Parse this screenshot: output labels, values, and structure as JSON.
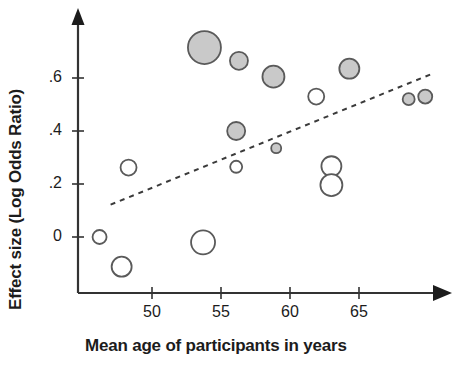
{
  "chart_data": {
    "type": "scatter",
    "title": "",
    "xlabel": "Mean age of participants in years",
    "ylabel": "Effect size (Log Odds Ratio)",
    "xlim": [
      45.2,
      72.0
    ],
    "ylim": [
      -0.16,
      0.82
    ],
    "xticks": [
      50,
      55,
      60,
      65
    ],
    "xtick_labels": [
      "50",
      "55",
      "60",
      "65"
    ],
    "yticks": [
      0,
      0.2,
      0.4,
      0.6
    ],
    "ytick_labels": [
      "0",
      ".2",
      ".4",
      ".6"
    ],
    "grid": false,
    "legend": "none",
    "marker_encoding": {
      "size": "study weight / sample size",
      "fill_gray": "statistically significant",
      "fill_white": "not statistically significant"
    },
    "colors": {
      "axis": "#333333",
      "marker_fill_gray": "#c9c9c9",
      "marker_fill_white": "#ffffff",
      "marker_stroke": "#5a5a5a",
      "trend_line": "#3a3a3a",
      "text": "#1c1c1c"
    },
    "points": [
      {
        "x": 53.8,
        "y": 0.715,
        "size": 16.5,
        "fill": "gray"
      },
      {
        "x": 56.3,
        "y": 0.665,
        "size": 9.0,
        "fill": "gray"
      },
      {
        "x": 58.8,
        "y": 0.605,
        "size": 11.0,
        "fill": "gray"
      },
      {
        "x": 64.3,
        "y": 0.635,
        "size": 10.0,
        "fill": "gray"
      },
      {
        "x": 61.9,
        "y": 0.53,
        "size": 8.0,
        "fill": "white"
      },
      {
        "x": 68.6,
        "y": 0.52,
        "size": 6.0,
        "fill": "gray"
      },
      {
        "x": 69.8,
        "y": 0.53,
        "size": 7.0,
        "fill": "gray"
      },
      {
        "x": 56.1,
        "y": 0.4,
        "size": 9.0,
        "fill": "gray"
      },
      {
        "x": 59.0,
        "y": 0.335,
        "size": 5.0,
        "fill": "gray"
      },
      {
        "x": 56.1,
        "y": 0.265,
        "size": 6.0,
        "fill": "white"
      },
      {
        "x": 48.3,
        "y": 0.262,
        "size": 8.0,
        "fill": "white"
      },
      {
        "x": 63.0,
        "y": 0.267,
        "size": 10.0,
        "fill": "white"
      },
      {
        "x": 63.0,
        "y": 0.196,
        "size": 11.0,
        "fill": "white"
      },
      {
        "x": 46.2,
        "y": 0.0,
        "size": 7.0,
        "fill": "white"
      },
      {
        "x": 53.7,
        "y": -0.02,
        "size": 12.0,
        "fill": "white"
      },
      {
        "x": 47.8,
        "y": -0.112,
        "size": 10.0,
        "fill": "white"
      }
    ],
    "trend_line": {
      "style": "dashed",
      "x_start": 47.0,
      "y_start": 0.122,
      "x_end": 70.3,
      "y_end": 0.616
    },
    "annotations": []
  }
}
